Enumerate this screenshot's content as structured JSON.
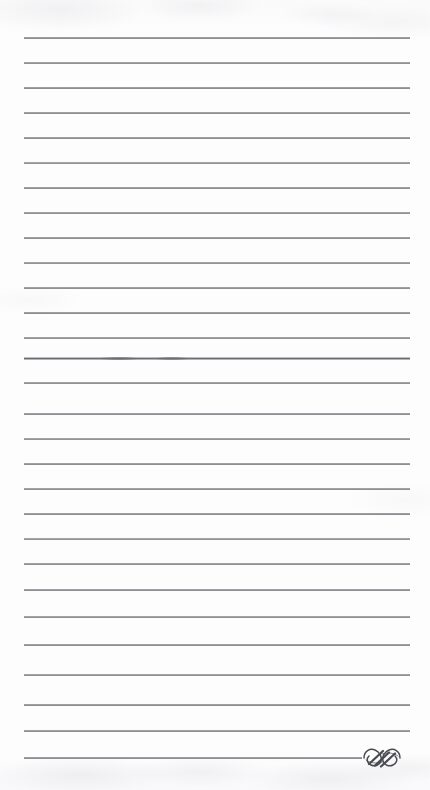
{
  "page": {
    "kind": "scanned-lined-notepad-page",
    "width_px": 430,
    "height_px": 790,
    "background_color": "#fdfdfd",
    "paper_tone": "#ffffff",
    "has_visible_text": false,
    "text_content": "",
    "note_label": "Blank ruled notepaper — no written content"
  },
  "rules": {
    "count": 29,
    "color": "#66666d",
    "thickness_px": 1,
    "spacing_px": 25,
    "first_line_y": 38,
    "last_line_y": 758,
    "left_x": 24,
    "right_x": 410,
    "lines": [
      {
        "index": 1,
        "y": 38,
        "x1": 24,
        "x2": 410,
        "opacity": 0.95,
        "smudge": false
      },
      {
        "index": 2,
        "y": 63,
        "x1": 24,
        "x2": 410,
        "opacity": 0.92,
        "smudge": false
      },
      {
        "index": 3,
        "y": 88,
        "x1": 24,
        "x2": 410,
        "opacity": 0.95,
        "smudge": false
      },
      {
        "index": 4,
        "y": 113,
        "x1": 24,
        "x2": 410,
        "opacity": 0.93,
        "smudge": false
      },
      {
        "index": 5,
        "y": 138,
        "x1": 24,
        "x2": 410,
        "opacity": 0.95,
        "smudge": false
      },
      {
        "index": 6,
        "y": 163,
        "x1": 24,
        "x2": 410,
        "opacity": 0.9,
        "smudge": false
      },
      {
        "index": 7,
        "y": 188,
        "x1": 24,
        "x2": 410,
        "opacity": 0.94,
        "smudge": false
      },
      {
        "index": 8,
        "y": 213,
        "x1": 24,
        "x2": 410,
        "opacity": 0.92,
        "smudge": false
      },
      {
        "index": 9,
        "y": 238,
        "x1": 24,
        "x2": 410,
        "opacity": 0.95,
        "smudge": false
      },
      {
        "index": 10,
        "y": 263,
        "x1": 24,
        "x2": 410,
        "opacity": 0.9,
        "smudge": false
      },
      {
        "index": 11,
        "y": 288,
        "x1": 24,
        "x2": 410,
        "opacity": 0.93,
        "smudge": false
      },
      {
        "index": 12,
        "y": 313,
        "x1": 24,
        "x2": 410,
        "opacity": 0.95,
        "smudge": false
      },
      {
        "index": 13,
        "y": 338,
        "x1": 24,
        "x2": 410,
        "opacity": 0.92,
        "smudge": false
      },
      {
        "index": 14,
        "y": 358,
        "x1": 24,
        "x2": 410,
        "opacity": 0.95,
        "smudge": true
      },
      {
        "index": 15,
        "y": 383,
        "x1": 24,
        "x2": 410,
        "opacity": 0.92,
        "smudge": false
      },
      {
        "index": 16,
        "y": 414,
        "x1": 24,
        "x2": 410,
        "opacity": 0.95,
        "smudge": false
      },
      {
        "index": 17,
        "y": 439,
        "x1": 24,
        "x2": 410,
        "opacity": 0.9,
        "smudge": false
      },
      {
        "index": 18,
        "y": 464,
        "x1": 24,
        "x2": 410,
        "opacity": 0.94,
        "smudge": false
      },
      {
        "index": 19,
        "y": 489,
        "x1": 24,
        "x2": 410,
        "opacity": 0.92,
        "smudge": false
      },
      {
        "index": 20,
        "y": 514,
        "x1": 24,
        "x2": 410,
        "opacity": 0.95,
        "smudge": false
      },
      {
        "index": 21,
        "y": 539,
        "x1": 24,
        "x2": 410,
        "opacity": 0.9,
        "smudge": false
      },
      {
        "index": 22,
        "y": 564,
        "x1": 24,
        "x2": 410,
        "opacity": 0.93,
        "smudge": false
      },
      {
        "index": 23,
        "y": 590,
        "x1": 24,
        "x2": 410,
        "opacity": 0.95,
        "smudge": false
      },
      {
        "index": 24,
        "y": 617,
        "x1": 24,
        "x2": 410,
        "opacity": 0.91,
        "smudge": false
      },
      {
        "index": 25,
        "y": 645,
        "x1": 24,
        "x2": 410,
        "opacity": 0.94,
        "smudge": false
      },
      {
        "index": 26,
        "y": 675,
        "x1": 24,
        "x2": 410,
        "opacity": 0.92,
        "smudge": false
      },
      {
        "index": 27,
        "y": 705,
        "x1": 24,
        "x2": 410,
        "opacity": 0.95,
        "smudge": false
      },
      {
        "index": 28,
        "y": 731,
        "x1": 24,
        "x2": 410,
        "opacity": 0.93,
        "smudge": false
      },
      {
        "index": 29,
        "y": 758,
        "x1": 24,
        "x2": 362,
        "opacity": 0.95,
        "smudge": false
      }
    ]
  },
  "ornament": {
    "name": "calligraphic-swash-flourish",
    "description": "Three-stroke calligraphic swash / scroll ornament terminating the final rule",
    "color": "#4a4a52",
    "x": 356,
    "y": 744,
    "width": 52,
    "height": 28
  }
}
